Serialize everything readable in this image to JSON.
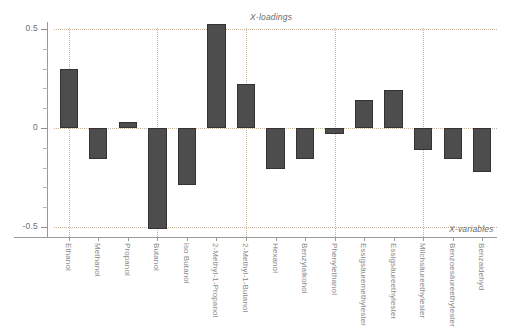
{
  "chart_data": {
    "type": "bar",
    "title": "",
    "xlabel": "X-variables",
    "ylabel": "X-loadings",
    "grid": true,
    "legend": "none",
    "ylim": [
      -0.58,
      0.58
    ],
    "yticks": [
      0.5,
      0,
      -0.5
    ],
    "ytick_labels": [
      "0.5",
      "0",
      "-0.5"
    ],
    "categories": [
      "Ethanol",
      "Methanol",
      "Propanol",
      "Butanol",
      "iso Butanol",
      "2-Methyl-1-Propanol",
      "2-Methyl-1-Butanol",
      "Hexanol",
      "Benzylalkohol",
      "Phenylethanol",
      "Essigsäuremethylester",
      "Essigsäureethylester",
      "Milchsäureethylester",
      "Benzoesäureethylester",
      "Benzaldehyd"
    ],
    "values": [
      0.3,
      -0.155,
      0.03,
      -0.51,
      -0.29,
      0.525,
      0.22,
      -0.205,
      -0.155,
      -0.03,
      0.14,
      0.19,
      -0.11,
      -0.155,
      -0.22
    ],
    "bar_color": "#4d4d4d",
    "grid_color": "#c8b49a",
    "axis_color": "#9a9a9a"
  },
  "annotations": {
    "loadings": "X-loadings",
    "variables": "X-variables"
  }
}
